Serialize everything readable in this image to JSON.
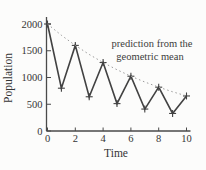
{
  "figure": {
    "background": "#fcfcfb",
    "line_color": "#424242",
    "marker_color": "#424242",
    "dotted_color": "#9b9b9b",
    "axis_color": "#4a4a4a",
    "text_color": "#343434"
  },
  "chart_data": {
    "type": "line",
    "title": "",
    "xlabel": "Time",
    "ylabel": "Population",
    "x": [
      0,
      1,
      2,
      3,
      4,
      5,
      6,
      7,
      8,
      9,
      10
    ],
    "series": [
      {
        "name": "observed-population",
        "style": "solid",
        "marker": "plus",
        "values": [
          2000,
          800,
          1600,
          640,
          1280,
          512,
          1024,
          410,
          819,
          328,
          655
        ]
      },
      {
        "name": "geometric-mean-prediction",
        "style": "dotted",
        "marker": "none",
        "values": [
          2000,
          1789,
          1600,
          1431,
          1280,
          1145,
          1024,
          916,
          819,
          733,
          655
        ]
      }
    ],
    "xlim": [
      0,
      10
    ],
    "ylim": [
      0,
      2000
    ],
    "xticks": [
      0,
      2,
      4,
      6,
      8,
      10
    ],
    "yticks": [
      0,
      500,
      1000,
      1500,
      2000
    ],
    "grid": false,
    "legend": "none",
    "annotation": {
      "line1": "prediction from the",
      "line2": "geometric mean"
    }
  }
}
